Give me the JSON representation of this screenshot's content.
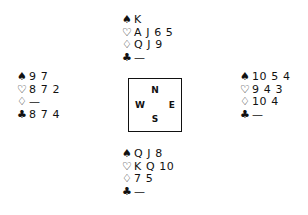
{
  "diagram": {
    "type": "bridge-deal",
    "suit_symbols": {
      "spades": "♠",
      "hearts": "♡",
      "diamonds": "♢",
      "clubs": "♣"
    },
    "void_mark": "—",
    "compass": {
      "north": "N",
      "south": "S",
      "west": "W",
      "east": "E"
    },
    "hands": {
      "north": {
        "spades": "K",
        "hearts": "A J 6 5",
        "diamonds": "Q J 9",
        "clubs": "—"
      },
      "west": {
        "spades": "9 7",
        "hearts": "8 7 2",
        "diamonds": "—",
        "clubs": "8 7 4"
      },
      "east": {
        "spades": "10 5 4",
        "hearts": "9 4 3",
        "diamonds": "10 4",
        "clubs": "—"
      },
      "south": {
        "spades": "Q J 8",
        "hearts": "K Q 10",
        "diamonds": "7 5",
        "clubs": "—"
      }
    }
  }
}
